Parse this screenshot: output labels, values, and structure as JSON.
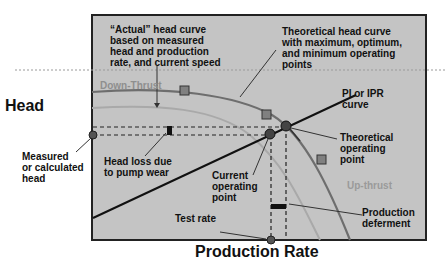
{
  "axes": {
    "y_label": "Head",
    "x_label": "Production Rate"
  },
  "annotations": {
    "actual_curve": [
      "“Actual” head curve",
      "based on measured",
      "head and production",
      "rate, and current speed"
    ],
    "theoretical_curve": [
      "Theoretical head curve",
      "with maximum, optimum,",
      "and minimum operating",
      "points"
    ],
    "pi_ipr": [
      "PI or IPR",
      "curve"
    ],
    "theoretical_point": [
      "Theoretical",
      "operating",
      "point"
    ],
    "current_point": [
      "Current",
      "operating",
      "point"
    ],
    "measured_head": [
      "Measured",
      "or calculated",
      "head"
    ],
    "head_loss": [
      "Head loss due",
      "to pump wear"
    ],
    "test_rate": "Test rate",
    "production_deferment": [
      "Production",
      "deferment"
    ],
    "down_thrust": "Down-Thrust",
    "up_thrust": "Up-thrust"
  },
  "colors": {
    "plot_bg": "#c4c4c4",
    "curve": "#6e6e6e",
    "light_curve": "#a9a9a9",
    "marker_square": "#808080",
    "marker_circle": "#444444",
    "text": "#111111",
    "faint_text": "#999999"
  }
}
